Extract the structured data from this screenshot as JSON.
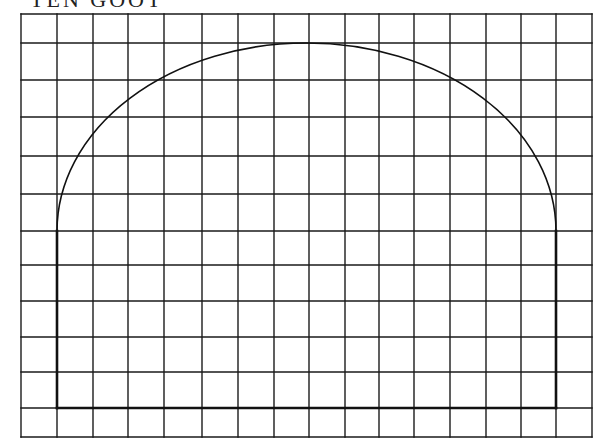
{
  "heading": {
    "text": "TEN GOOT",
    "note": "top of heading cropped by image edge"
  },
  "grid": {
    "columns": 16,
    "rows": 12,
    "x_lines": [
      21,
      57,
      93,
      128,
      164,
      202,
      238,
      274,
      309,
      345,
      379,
      414,
      450,
      486,
      521,
      556,
      592
    ],
    "y_lines": [
      14,
      43,
      80,
      117,
      156,
      194,
      231,
      265,
      301,
      337,
      372,
      408,
      437
    ],
    "line_color": "#1a1a1a"
  },
  "arch": {
    "left_x": 57,
    "right_x": 556,
    "spring_y": 231,
    "apex_y": 43,
    "base_y": 408,
    "center_x": 306.5,
    "shape": "semi-elliptical arch on vertical jambs",
    "stroke_color": "#111111"
  }
}
